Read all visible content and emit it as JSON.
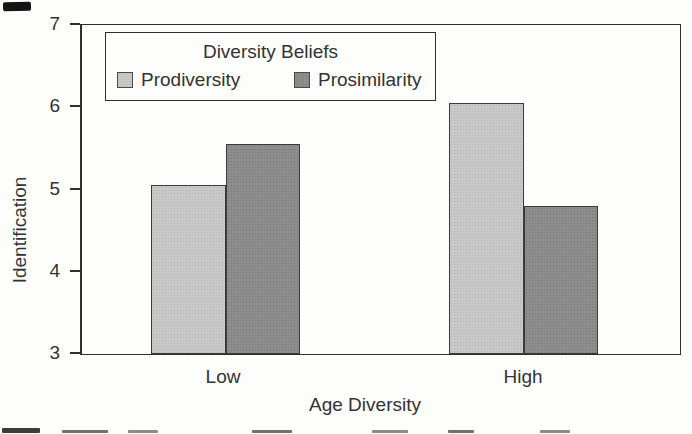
{
  "chart_data": {
    "type": "bar",
    "title": "",
    "categories": [
      "Low",
      "High"
    ],
    "series": [
      {
        "name": "Prodiversity",
        "values": [
          5.05,
          6.05
        ],
        "color": "#c8c8c8"
      },
      {
        "name": "Prosimilarity",
        "values": [
          5.55,
          4.8
        ],
        "color": "#8d8d8d"
      }
    ],
    "xlabel": "Age Diversity",
    "ylabel": "Identification",
    "ylim": [
      3,
      7
    ],
    "yticks": [
      3,
      4,
      5,
      6,
      7
    ],
    "grid": false,
    "legend": {
      "title": "Diversity Beliefs",
      "position": "top-left-inside",
      "entries": [
        "Prodiversity",
        "Prosimilarity"
      ]
    },
    "colors": {
      "frame": "#2f2f2f",
      "text": "#333333",
      "background": "#fdfdfc"
    }
  }
}
